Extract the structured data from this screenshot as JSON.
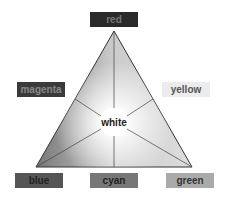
{
  "diagram": {
    "vertices": {
      "top": "red",
      "bottom_left": "blue",
      "bottom_right": "green"
    },
    "edges": {
      "left": "magenta",
      "right": "yellow",
      "bottom": "cyan"
    },
    "center": "white"
  },
  "labels": {
    "red": {
      "text": "red",
      "bg": "#2a2a2a",
      "fg": "#6a6a6a"
    },
    "magenta": {
      "text": "magenta",
      "bg": "#3a3a3a",
      "fg": "#7a7a7a"
    },
    "yellow": {
      "text": "yellow",
      "bg": "#ececec",
      "fg": "#555555"
    },
    "blue": {
      "text": "blue",
      "bg": "#555555",
      "fg": "#222222"
    },
    "cyan": {
      "text": "cyan",
      "bg": "#777777",
      "fg": "#222222"
    },
    "green": {
      "text": "green",
      "bg": "#aaaaaa",
      "fg": "#333333"
    },
    "white": {
      "text": "white"
    }
  }
}
